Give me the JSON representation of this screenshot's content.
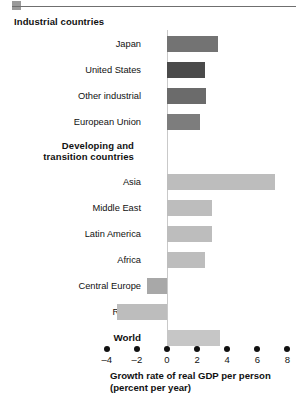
{
  "chart_data": {
    "type": "bar",
    "orientation": "horizontal",
    "title": "",
    "xlabel": "Growth rate of real GDP per person (percent per year)",
    "xlabel_line1": "Growth rate of real GDP per person",
    "xlabel_line2": "(percent per year)",
    "ylabel": "",
    "xlim": [
      -4,
      8
    ],
    "xticks": [
      -4,
      -2,
      0,
      2,
      4,
      6,
      8
    ],
    "xticklabels": [
      "–4",
      "–2",
      "0",
      "2",
      "4",
      "6",
      "8"
    ],
    "grid": false,
    "legend": null,
    "zero_line": true,
    "groups": [
      {
        "heading": "Industrial countries",
        "heading_align": "left",
        "categories": [
          "Japan",
          "United States",
          "Other industrial",
          "European Union"
        ],
        "values": [
          3.4,
          2.5,
          2.6,
          2.2
        ],
        "colors": [
          "#737373",
          "#4a4a4a",
          "#6b6b6b",
          "#7d7d7d"
        ]
      },
      {
        "heading": "Developing and transition countries",
        "heading_line1": "Developing and",
        "heading_line2": "transition countries",
        "heading_align": "right",
        "categories": [
          "Asia",
          "Middle East",
          "Latin America",
          "Africa",
          "Central Europe",
          "Russia"
        ],
        "values": [
          7.2,
          3.0,
          3.0,
          2.5,
          -1.3,
          -3.3
        ],
        "colors": [
          "#bdbdbd",
          "#bdbdbd",
          "#bdbdbd",
          "#bdbdbd",
          "#a8a8a8",
          "#bdbdbd"
        ]
      },
      {
        "heading": "",
        "heading_align": "right",
        "categories": [
          "World"
        ],
        "values": [
          3.5
        ],
        "colors": [
          "#c6c6c6"
        ],
        "bold_labels": true
      }
    ],
    "series": [
      {
        "name": "Japan",
        "value": 3.4
      },
      {
        "name": "United States",
        "value": 2.5
      },
      {
        "name": "Other industrial",
        "value": 2.6
      },
      {
        "name": "European Union",
        "value": 2.2
      },
      {
        "name": "Asia",
        "value": 7.2
      },
      {
        "name": "Middle East",
        "value": 3.0
      },
      {
        "name": "Latin America",
        "value": 3.0
      },
      {
        "name": "Africa",
        "value": 2.5
      },
      {
        "name": "Central Europe",
        "value": -1.3
      },
      {
        "name": "Russia",
        "value": -3.3
      },
      {
        "name": "World",
        "value": 3.5
      }
    ]
  },
  "headings": {
    "industrial": "Industrial countries",
    "developing_line1": "Developing and",
    "developing_line2": "transition countries"
  },
  "labels": {
    "japan": "Japan",
    "united_states": "United States",
    "other_industrial": "Other industrial",
    "european_union": "European Union",
    "asia": "Asia",
    "middle_east": "Middle East",
    "latin_america": "Latin America",
    "africa": "Africa",
    "central_europe": "Central Europe",
    "russia": "Russia",
    "world": "World"
  },
  "axis": {
    "tick_m4": "–4",
    "tick_m2": "–2",
    "tick_0": "0",
    "tick_2": "2",
    "tick_4": "4",
    "tick_6": "6",
    "tick_8": "8",
    "title_line1": "Growth rate of real GDP per person",
    "title_line2": "(percent per year)"
  },
  "colors": {
    "bar_dark": "#4a4a4a",
    "bar_mid": "#737373",
    "bar_light": "#bdbdbd",
    "zero_line": "#c9c9c9",
    "text": "#111111"
  }
}
